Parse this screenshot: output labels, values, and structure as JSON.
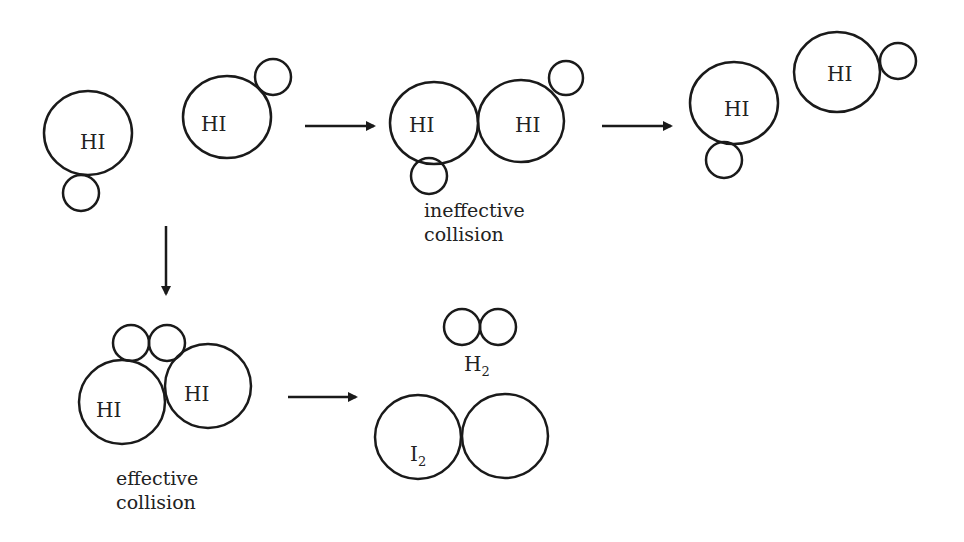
{
  "diagram": {
    "molecule_label": "HI",
    "stages": {
      "reactants": {
        "molecules": [
          "HI",
          "HI"
        ]
      },
      "ineffective": {
        "molecules": [
          "HI",
          "HI"
        ],
        "caption_line1": "ineffective",
        "caption_line2": "collision"
      },
      "rebound": {
        "molecules": [
          "HI",
          "HI"
        ]
      },
      "effective": {
        "molecules": [
          "HI",
          "HI"
        ],
        "caption_line1": "effective",
        "caption_line2": "collision"
      },
      "products": {
        "h2": "H",
        "h2_sub": "2",
        "i2": "I",
        "i2_sub": "2"
      }
    },
    "arrows": [
      "reactants-to-ineffective",
      "ineffective-to-rebound",
      "reactants-to-effective",
      "effective-to-products"
    ],
    "stroke_color": "#1a1a1a"
  }
}
